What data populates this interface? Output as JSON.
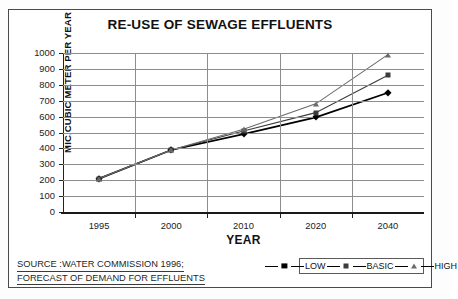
{
  "chart_data": {
    "type": "line",
    "title": "RE-USE OF SEWAGE EFFLUENTS",
    "xlabel": "YEAR",
    "ylabel": "MIC.CUBIC METER PER YEAR",
    "categories": [
      "1995",
      "2000",
      "2010",
      "2020",
      "2040"
    ],
    "ylim": [
      0,
      1000
    ],
    "yticks": [
      "0",
      "100",
      "200",
      "300",
      "400",
      "500",
      "600",
      "700",
      "800",
      "900",
      "1000"
    ],
    "grid": "horizontal-and-vertical",
    "legend_position": "bottom-right",
    "series": [
      {
        "name": "LOW",
        "marker": "diamond",
        "color": "#000000",
        "values": [
          210,
          390,
          490,
          595,
          750
        ]
      },
      {
        "name": "BASIC",
        "marker": "square",
        "color": "#3c3c3c",
        "values": [
          210,
          390,
          510,
          625,
          860
        ]
      },
      {
        "name": "HIGH",
        "marker": "triangle",
        "color": "#6b6b6b",
        "values": [
          210,
          390,
          520,
          680,
          990
        ]
      }
    ],
    "annotations": {
      "source_line1": "SOURCE :WATER COMMISSION 1996;",
      "source_line2": "FORECAST OF DEMAND FOR EFFLUENTS"
    }
  },
  "legend": {
    "items": [
      {
        "label": "LOW",
        "icon": "diamond-marker-icon"
      },
      {
        "label": "BASIC",
        "icon": "square-marker-icon"
      },
      {
        "label": "HIGH",
        "icon": "triangle-marker-icon"
      }
    ]
  }
}
